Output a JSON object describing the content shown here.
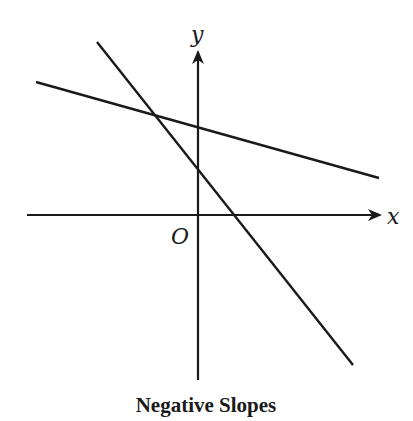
{
  "figure": {
    "caption": "Negative Slopes",
    "axes": {
      "x_label": "x",
      "y_label": "y",
      "origin_label": "O"
    },
    "lines": [
      {
        "name": "shallow-negative-slope-line",
        "x1": 36,
        "y1": 82,
        "x2": 379,
        "y2": 178
      },
      {
        "name": "steep-negative-slope-line",
        "x1": 97,
        "y1": 42,
        "x2": 353,
        "y2": 365
      }
    ],
    "colors": {
      "stroke": "#1a1a1a",
      "background": "#ffffff"
    }
  }
}
